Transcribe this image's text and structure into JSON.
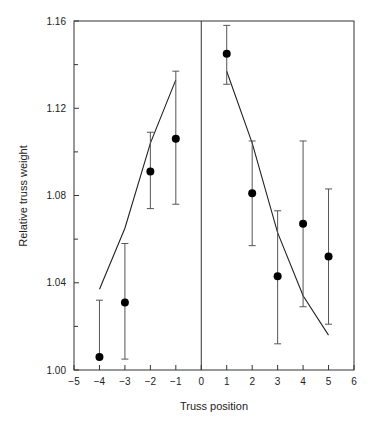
{
  "chart_data": {
    "type": "scatter",
    "title": "",
    "xlabel": "Truss position",
    "ylabel": "Relative truss weight",
    "xlim": [
      -5,
      6
    ],
    "ylim": [
      1.0,
      1.16
    ],
    "x_ticks": [
      -5,
      -4,
      -3,
      -2,
      -1,
      0,
      1,
      2,
      3,
      4,
      5,
      6
    ],
    "x_tick_labels": [
      "−5",
      "−4",
      "−3",
      "−2",
      "−1",
      "0",
      "1",
      "2",
      "3",
      "4",
      "5",
      "6"
    ],
    "y_ticks": [
      1.0,
      1.04,
      1.08,
      1.12,
      1.16
    ],
    "y_tick_labels": [
      "1.00",
      "1.04",
      "1.08",
      "1.12",
      "1.16"
    ],
    "y_minor_ticks": [
      1.02,
      1.06,
      1.1,
      1.14
    ],
    "grid": false,
    "legend": null,
    "vertical_reference_line_x": 0,
    "series": [
      {
        "name": "Observed mean (with error bars)",
        "kind": "points",
        "x": [
          -4,
          -3,
          -2,
          -1,
          1,
          2,
          3,
          4,
          5
        ],
        "values": [
          1.006,
          1.031,
          1.091,
          1.106,
          1.145,
          1.081,
          1.043,
          1.067,
          1.052
        ],
        "err_upper": [
          1.032,
          1.058,
          1.109,
          1.137,
          1.158,
          1.105,
          1.073,
          1.105,
          1.083
        ],
        "err_lower": [
          null,
          1.005,
          1.074,
          1.076,
          1.131,
          1.057,
          1.012,
          1.029,
          1.021
        ]
      },
      {
        "name": "Model fit (left)",
        "kind": "line",
        "x": [
          -4,
          -3,
          -2,
          -1
        ],
        "values": [
          1.037,
          1.065,
          1.104,
          1.133
        ]
      },
      {
        "name": "Model fit (right)",
        "kind": "line",
        "x": [
          1,
          2,
          3,
          4,
          5
        ],
        "values": [
          1.137,
          1.104,
          1.063,
          1.034,
          1.016
        ]
      }
    ]
  }
}
